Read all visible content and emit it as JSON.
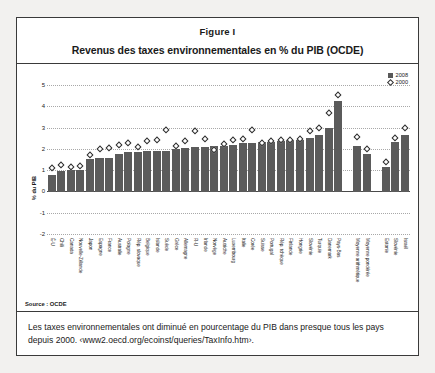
{
  "figure": {
    "label": "Figure I",
    "title": "Revenus des taxes environnementales en % du PIB (OCDE)",
    "source": "Source : OCDE",
    "caption": "Les taxes environnementales ont diminué en pourcentage du PIB dans presque tous les pays depuis 2000. ‹www2.oecd.org/ecoinst/queries/TaxInfo.htm›."
  },
  "chart_data": {
    "type": "bar",
    "title": "Revenus des taxes environnementales en % du PIB (OCDE)",
    "xlabel": "",
    "ylabel": "% du PIB",
    "ylim": [
      -2,
      5
    ],
    "yticks": [
      5,
      4,
      3,
      2,
      1,
      0,
      -1,
      -2
    ],
    "grid": true,
    "legend_position": "top-right",
    "legend": [
      "2008",
      "2000"
    ],
    "colors": {
      "bar_2008": "#5b5b5b",
      "marker_2000": "#ffffff",
      "marker_edge": "#2b2b2b"
    },
    "categories": [
      "É-U",
      "Chili",
      "Canada",
      "Nouvelle-Zélande",
      "Japon",
      "Espagne",
      "France",
      "Australie",
      "Pologne",
      "Rép. slovaque",
      "Belgique",
      "Islande",
      "Suède",
      "Grèce",
      "Allemagne",
      "R-U",
      "Irlande",
      "Norvège",
      "Autriche",
      "Luxembourg",
      "Italie",
      "Corée",
      "Suisse",
      "Portugal",
      "Rép. tchèque",
      "Finlande",
      "Hongrie",
      "Slovénie",
      "Turquie",
      "Danemark",
      "Pays-Bas",
      "",
      "Moyenne arithmétique",
      "Moyenne pondérée",
      "",
      "Estonie",
      "Slovénie",
      "Israël"
    ],
    "series": [
      {
        "name": "2008",
        "values": [
          0.8,
          1.02,
          1.05,
          1.05,
          1.55,
          1.6,
          1.62,
          1.8,
          1.88,
          1.9,
          1.95,
          1.95,
          1.95,
          2.05,
          2.1,
          2.12,
          2.15,
          2.18,
          2.2,
          2.25,
          2.3,
          2.32,
          2.35,
          2.38,
          2.42,
          2.45,
          2.48,
          2.55,
          2.72,
          3.05,
          4.3,
          null,
          2.18,
          1.8,
          null,
          1.2,
          2.38,
          2.7
        ]
      },
      {
        "name": "2000",
        "values": [
          1.15,
          1.3,
          1.22,
          1.25,
          1.8,
          2.05,
          2.1,
          2.25,
          2.35,
          2.15,
          2.42,
          2.48,
          2.95,
          2.2,
          2.45,
          2.9,
          2.52,
          2.0,
          2.28,
          2.48,
          2.52,
          2.95,
          2.35,
          2.45,
          2.48,
          2.5,
          2.55,
          2.92,
          3.05,
          3.75,
          4.62,
          null,
          2.62,
          2.08,
          null,
          1.45,
          2.58,
          3.05
        ]
      }
    ]
  }
}
